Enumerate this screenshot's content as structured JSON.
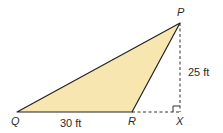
{
  "figure": {
    "type": "triangle-diagram",
    "fill_color": "#F8E6B0",
    "stroke_color": "#222222",
    "vertices": [
      {
        "label": "P",
        "x": 180,
        "y": 23
      },
      {
        "label": "Q",
        "x": 17,
        "y": 112
      },
      {
        "label": "R",
        "x": 132,
        "y": 112
      }
    ],
    "foot_point": {
      "label": "X",
      "x": 180,
      "y": 112
    },
    "measurements": {
      "qr": "30 ft",
      "px": "25 ft"
    },
    "right_angle_at": "X"
  },
  "labels": {
    "p": "P",
    "q": "Q",
    "r": "R",
    "x": "X",
    "qr_length": "30 ft",
    "px_height": "25 ft"
  }
}
